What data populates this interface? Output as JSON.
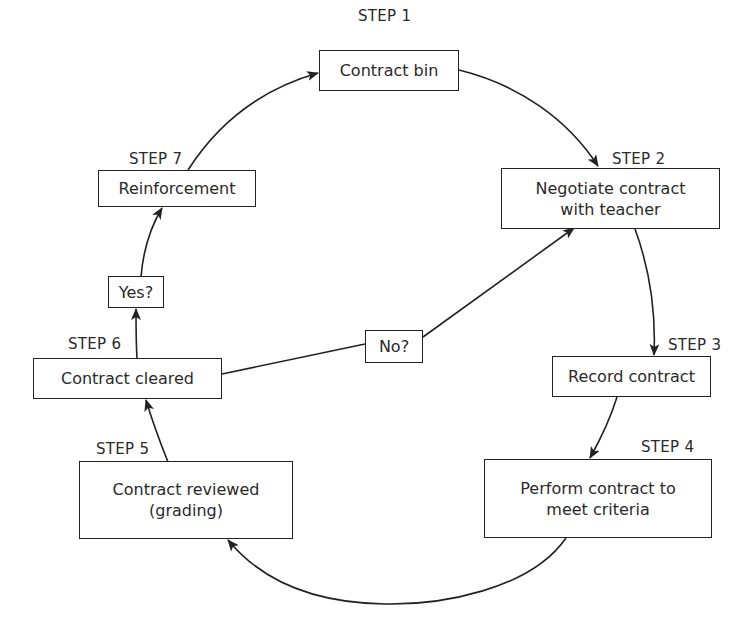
{
  "diagram": {
    "type": "cycle-flowchart",
    "steps": [
      {
        "id": "step1",
        "step_label": "STEP 1",
        "lines": [
          "Contract bin"
        ]
      },
      {
        "id": "step2",
        "step_label": "STEP 2",
        "lines": [
          "Negotiate contract",
          "with teacher"
        ]
      },
      {
        "id": "step3",
        "step_label": "STEP 3",
        "lines": [
          "Record contract"
        ]
      },
      {
        "id": "step4",
        "step_label": "STEP 4",
        "lines": [
          "Perform contract to",
          "meet criteria"
        ]
      },
      {
        "id": "step5",
        "step_label": "STEP 5",
        "lines": [
          "Contract reviewed",
          "(grading)"
        ]
      },
      {
        "id": "step6",
        "step_label": "STEP 6",
        "lines": [
          "Contract cleared"
        ]
      },
      {
        "id": "step7",
        "step_label": "STEP 7",
        "lines": [
          "Reinforcement"
        ]
      }
    ],
    "decisions": [
      {
        "id": "yes",
        "label": "Yes?"
      },
      {
        "id": "no",
        "label": "No?"
      }
    ],
    "edges": [
      {
        "from": "step1",
        "to": "step2"
      },
      {
        "from": "step2",
        "to": "step3"
      },
      {
        "from": "step3",
        "to": "step4"
      },
      {
        "from": "step4",
        "to": "step5"
      },
      {
        "from": "step5",
        "to": "step6"
      },
      {
        "from": "step6",
        "to": "yes"
      },
      {
        "from": "yes",
        "to": "step7"
      },
      {
        "from": "step7",
        "to": "step1"
      },
      {
        "from": "step6",
        "to": "no"
      },
      {
        "from": "no",
        "to": "step2"
      }
    ],
    "colors": {
      "line": "#222222",
      "text": "#2a2a2a",
      "background": "#ffffff"
    }
  }
}
